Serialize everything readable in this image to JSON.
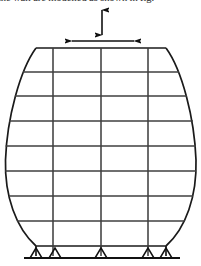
{
  "figure": {
    "caption_fragment": "the wall are modelled as shown in fig."
  },
  "annotations": {
    "vertical_arrow": {
      "name": "vertical-dimension-arrow",
      "label": "",
      "x": 102,
      "y_top": 8,
      "y_bottom": 36,
      "double_headed": true
    },
    "horizontal_arrow": {
      "name": "horizontal-dimension-arrow",
      "label": "",
      "y": 41,
      "x_left": 70,
      "x_right": 136,
      "double_headed": true
    }
  },
  "structure": {
    "type": "barrel-frame-elevation",
    "stroke_color": "#1a1a1a",
    "grid_color": "#4a4a4a",
    "top_chord": {
      "y": 48,
      "x_left": 36,
      "x_right": 166
    },
    "widest": {
      "y": 160,
      "x_left": 5,
      "x_right": 196
    },
    "base_chord": {
      "y": 246,
      "x_left": 36,
      "x_right": 166
    },
    "floor_levels": [
      48,
      72,
      96,
      120,
      145,
      170,
      195,
      220,
      246
    ],
    "column_x": [
      53,
      101,
      148
    ],
    "num_bays": 4,
    "num_storeys": 8
  },
  "ground": {
    "line_y": 258,
    "x_left": 24,
    "x_right": 180,
    "supports": [
      {
        "name": "support-1",
        "x": 36
      },
      {
        "name": "support-2",
        "x": 55
      },
      {
        "name": "support-3",
        "x": 101
      },
      {
        "name": "support-4",
        "x": 148
      },
      {
        "name": "support-5",
        "x": 166
      }
    ],
    "support_type": "pinned",
    "support_width": 13,
    "support_height": 10
  }
}
